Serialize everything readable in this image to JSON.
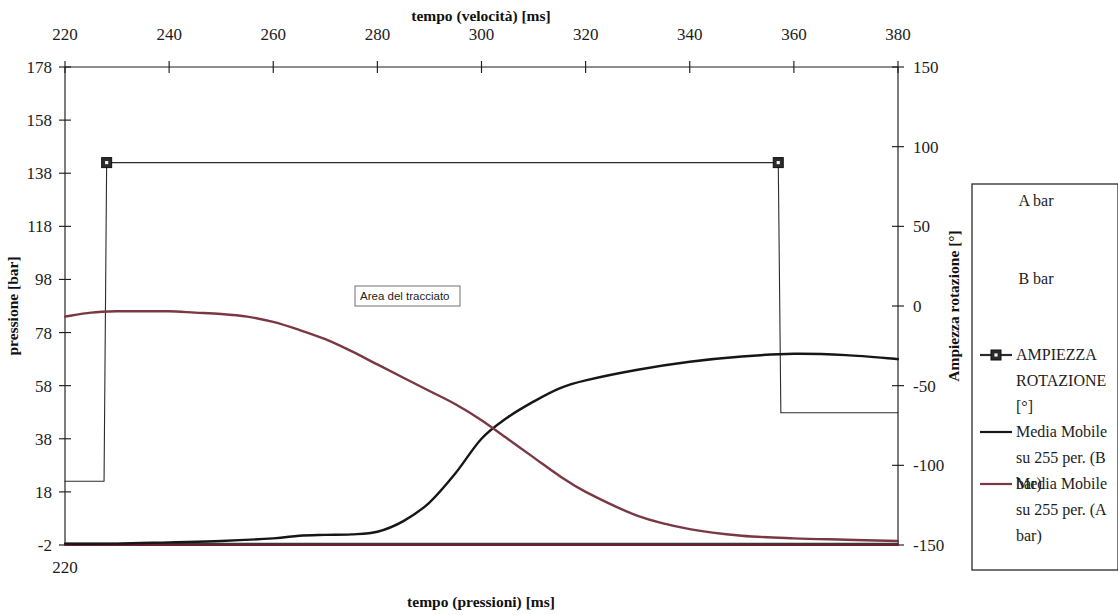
{
  "chart_data": {
    "type": "line",
    "title": "",
    "top_axis": {
      "label": "tempo (velocità) [ms]",
      "ticks": [
        220,
        240,
        260,
        280,
        300,
        320,
        340,
        360,
        380
      ],
      "range": [
        220,
        380
      ]
    },
    "bottom_axis": {
      "label": "tempo (pressioni) [ms]",
      "ticks": [
        220
      ],
      "range": [
        220,
        380
      ]
    },
    "left_axis": {
      "label": "pressione [bar]",
      "ticks": [
        178,
        158,
        138,
        118,
        98,
        78,
        58,
        38,
        18,
        -2
      ],
      "range": [
        -2,
        178
      ]
    },
    "right_axis": {
      "label": "Ampiezza rotazione [°]",
      "ticks": [
        150,
        100,
        50,
        0,
        -50,
        -100,
        -150
      ],
      "range": [
        -150,
        150
      ]
    },
    "grid": false,
    "legend_position": "right",
    "annotation": {
      "text": "Area del tracciato"
    },
    "series": [
      {
        "name": "A bar",
        "axis": "left",
        "color": "#3a3a3a",
        "marker": "none",
        "note": "raw pressure A, flat near -2 bar along bottom",
        "x": [
          220,
          240,
          260,
          280,
          300,
          320,
          340,
          360,
          380
        ],
        "values": [
          -1.5,
          -1.5,
          -1.5,
          -1.5,
          -1.5,
          -1.5,
          -1.5,
          -1.5,
          -1.5
        ]
      },
      {
        "name": "B bar",
        "axis": "left",
        "color": "#6b2030",
        "marker": "none",
        "note": "raw pressure B, flat near -2 bar along bottom",
        "x": [
          220,
          240,
          260,
          280,
          300,
          320,
          340,
          360,
          380
        ],
        "values": [
          -2,
          -2,
          -2,
          -2,
          -2,
          -2,
          -2,
          -2,
          -2
        ]
      },
      {
        "name": "AMPIEZZA ROTAZIONE [°]",
        "axis": "right",
        "color": "#2b2b2b",
        "marker": "square",
        "note": "step signal: low -110, jumps to 90 at ~228 ms, drops to -67 at ~357 ms",
        "x": [
          220,
          227.5,
          228,
          357,
          357.5,
          380
        ],
        "values": [
          -110,
          -110,
          90,
          90,
          -67,
          -67
        ]
      },
      {
        "name": "Media Mobile su 255 per. (B bar)",
        "axis": "left",
        "color": "#161616",
        "marker": "none",
        "note": "rising moving-average curve, crosses A at ~300 ms / 46 bar, peaks ~70 bar",
        "x": [
          220,
          230,
          240,
          250,
          260,
          265,
          270,
          275,
          280,
          285,
          290,
          295,
          300,
          305,
          310,
          315,
          320,
          330,
          340,
          350,
          360,
          370,
          380
        ],
        "values": [
          -1.5,
          -1.5,
          -1.0,
          -0.5,
          0.5,
          1.5,
          1.8,
          2.0,
          3.0,
          7.0,
          14.0,
          25.0,
          38.0,
          46.0,
          52.0,
          57.0,
          60.0,
          64.0,
          67.0,
          69.0,
          70.0,
          69.5,
          68.0
        ]
      },
      {
        "name": "Media Mobile su 255 per. (A bar)",
        "axis": "left",
        "color": "#7a3844",
        "marker": "none",
        "note": "falling moving-average curve, starts ~85 bar plateau, decays to ~0 bar",
        "x": [
          220,
          225,
          230,
          235,
          240,
          245,
          250,
          255,
          260,
          265,
          270,
          275,
          280,
          285,
          290,
          295,
          300,
          305,
          310,
          315,
          320,
          330,
          340,
          350,
          360,
          370,
          380
        ],
        "values": [
          84.0,
          85.5,
          86.0,
          86.0,
          86.0,
          85.5,
          85.0,
          84.0,
          82.0,
          79.0,
          75.5,
          71.0,
          66.0,
          61.0,
          56.0,
          51.0,
          45.0,
          38.0,
          31.0,
          24.0,
          18.0,
          9.0,
          4.0,
          1.5,
          0.5,
          0.0,
          -0.5
        ]
      }
    ]
  },
  "legend": {
    "items": [
      {
        "label": "A bar",
        "marker": "none",
        "color": "#3a3a3a"
      },
      {
        "label": "B bar",
        "marker": "none",
        "color": "#6b2030"
      },
      {
        "label": "AMPIEZZA ROTAZIONE [°]",
        "marker": "square-line",
        "color": "#2b2b2b"
      },
      {
        "label": "Media Mobile su 255 per. (B bar)",
        "marker": "line",
        "color": "#161616"
      },
      {
        "label": "Media Mobile su 255 per. (A bar)",
        "marker": "line",
        "color": "#7a3844"
      }
    ]
  },
  "colors": {
    "axis": "#1d1d1d",
    "series_black": "#161616",
    "series_maroon": "#7a3844",
    "background": "#ffffff"
  }
}
